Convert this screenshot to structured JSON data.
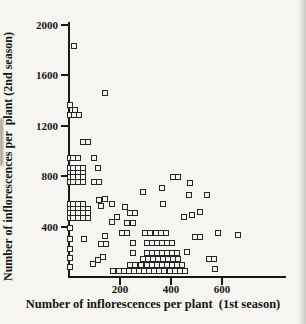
{
  "figure": {
    "x_title": "Number of inflorescences per plant  (1st season)",
    "y_title": "Number of inflorescences per  plant (2nd season)"
  },
  "colors": {
    "ink": "#191919",
    "paper": "#f6f5f1",
    "marker_border": "#262626"
  },
  "chart_data": {
    "type": "scatter",
    "title": "",
    "xlabel": "Number of inflorescences per plant (1st season)",
    "ylabel": "Number of inflorescences per plant (2nd season)",
    "marker": "open-square",
    "grid": false,
    "legend": null,
    "xlim": [
      0,
      850
    ],
    "ylim": [
      0,
      2020
    ],
    "x_ticks": [
      {
        "value": 200,
        "label": "200"
      },
      {
        "value": 400,
        "label": "400"
      },
      {
        "value": 600,
        "label": "600"
      }
    ],
    "y_ticks": [
      {
        "value": 400,
        "label": "400"
      },
      {
        "value": 800,
        "label": "800"
      },
      {
        "value": 1200,
        "label": "1200"
      },
      {
        "value": 1600,
        "label": "1600"
      },
      {
        "value": 2000,
        "label": "2000"
      }
    ],
    "points": [
      [
        20,
        1830
      ],
      [
        140,
        1455
      ],
      [
        5,
        1360
      ],
      [
        25,
        1320
      ],
      [
        5,
        1280
      ],
      [
        20,
        1280
      ],
      [
        40,
        1280
      ],
      [
        55,
        1065
      ],
      [
        75,
        1065
      ],
      [
        5,
        940
      ],
      [
        15,
        940
      ],
      [
        38,
        940
      ],
      [
        100,
        940
      ],
      [
        5,
        865
      ],
      [
        15,
        865
      ],
      [
        35,
        865
      ],
      [
        55,
        865
      ],
      [
        115,
        860
      ],
      [
        5,
        825
      ],
      [
        15,
        825
      ],
      [
        35,
        825
      ],
      [
        55,
        825
      ],
      [
        5,
        790
      ],
      [
        15,
        790
      ],
      [
        35,
        790
      ],
      [
        55,
        790
      ],
      [
        5,
        750
      ],
      [
        15,
        750
      ],
      [
        35,
        750
      ],
      [
        55,
        750
      ],
      [
        100,
        750
      ],
      [
        120,
        750
      ],
      [
        410,
        790
      ],
      [
        430,
        790
      ],
      [
        475,
        740
      ],
      [
        365,
        700
      ],
      [
        290,
        670
      ],
      [
        470,
        645
      ],
      [
        540,
        645
      ],
      [
        5,
        580
      ],
      [
        15,
        580
      ],
      [
        35,
        580
      ],
      [
        55,
        580
      ],
      [
        5,
        540
      ],
      [
        15,
        540
      ],
      [
        35,
        540
      ],
      [
        55,
        540
      ],
      [
        75,
        540
      ],
      [
        5,
        505
      ],
      [
        15,
        505
      ],
      [
        35,
        505
      ],
      [
        55,
        505
      ],
      [
        75,
        505
      ],
      [
        5,
        465
      ],
      [
        15,
        465
      ],
      [
        35,
        465
      ],
      [
        55,
        465
      ],
      [
        75,
        465
      ],
      [
        120,
        605
      ],
      [
        140,
        615
      ],
      [
        125,
        560
      ],
      [
        170,
        580
      ],
      [
        220,
        550
      ],
      [
        240,
        505
      ],
      [
        260,
        505
      ],
      [
        190,
        470
      ],
      [
        170,
        435
      ],
      [
        250,
        430
      ],
      [
        370,
        580
      ],
      [
        450,
        470
      ],
      [
        485,
        490
      ],
      [
        515,
        510
      ],
      [
        5,
        385
      ],
      [
        5,
        300
      ],
      [
        5,
        220
      ],
      [
        5,
        145
      ],
      [
        5,
        75
      ],
      [
        60,
        300
      ],
      [
        140,
        320
      ],
      [
        125,
        260
      ],
      [
        145,
        260
      ],
      [
        95,
        100
      ],
      [
        115,
        130
      ],
      [
        135,
        160
      ],
      [
        230,
        425
      ],
      [
        210,
        345
      ],
      [
        230,
        345
      ],
      [
        300,
        345
      ],
      [
        320,
        345
      ],
      [
        340,
        345
      ],
      [
        360,
        345
      ],
      [
        380,
        345
      ],
      [
        585,
        345
      ],
      [
        665,
        330
      ],
      [
        495,
        315
      ],
      [
        515,
        315
      ],
      [
        250,
        265
      ],
      [
        305,
        265
      ],
      [
        325,
        265
      ],
      [
        345,
        265
      ],
      [
        365,
        265
      ],
      [
        385,
        265
      ],
      [
        405,
        265
      ],
      [
        250,
        185
      ],
      [
        305,
        185
      ],
      [
        325,
        185
      ],
      [
        345,
        185
      ],
      [
        365,
        185
      ],
      [
        385,
        185
      ],
      [
        405,
        185
      ],
      [
        425,
        185
      ],
      [
        465,
        195
      ],
      [
        550,
        140
      ],
      [
        570,
        140
      ],
      [
        290,
        140
      ],
      [
        310,
        140
      ],
      [
        330,
        140
      ],
      [
        350,
        140
      ],
      [
        370,
        140
      ],
      [
        390,
        140
      ],
      [
        410,
        140
      ],
      [
        430,
        140
      ],
      [
        240,
        90
      ],
      [
        260,
        90
      ],
      [
        285,
        90
      ],
      [
        305,
        90
      ],
      [
        325,
        90
      ],
      [
        345,
        90
      ],
      [
        365,
        90
      ],
      [
        385,
        90
      ],
      [
        405,
        90
      ],
      [
        425,
        90
      ],
      [
        445,
        90
      ],
      [
        175,
        45
      ],
      [
        195,
        45
      ],
      [
        215,
        45
      ],
      [
        235,
        45
      ],
      [
        255,
        45
      ],
      [
        275,
        45
      ],
      [
        295,
        45
      ],
      [
        315,
        45
      ],
      [
        335,
        45
      ],
      [
        355,
        45
      ],
      [
        375,
        45
      ],
      [
        395,
        45
      ],
      [
        415,
        45
      ],
      [
        435,
        45
      ],
      [
        455,
        45
      ],
      [
        575,
        65
      ]
    ]
  }
}
